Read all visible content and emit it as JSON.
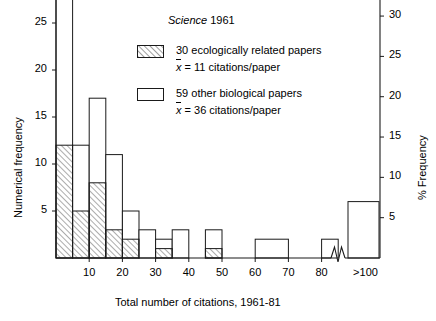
{
  "chart_data": {
    "type": "bar",
    "title_italic_part": "Science",
    "title_year": "1961",
    "xlabel": "Total number of citations,  1961-81",
    "ylabel": "Numerical frequency",
    "ylabel_right": "% Frequency",
    "ylim": [
      0,
      32
    ],
    "ylim_right": [
      0,
      37.3
    ],
    "yticks": [
      5,
      10,
      15,
      20,
      25,
      30
    ],
    "yticks_right": [
      5,
      10,
      15,
      20,
      25,
      30,
      35
    ],
    "xticks": [
      "10",
      "20",
      "30",
      "40",
      "50",
      "60",
      "70",
      "80",
      ">100"
    ],
    "grid": false,
    "legend_position": "upper-center",
    "axis_break": true,
    "axis_break_label": ">100",
    "bin_width": 5,
    "series": [
      {
        "name": "30 ecologically related papers",
        "mean_label": "x̄ = 11 citations/paper",
        "mean_value": 11,
        "count": 30,
        "fill": "hatched",
        "bins": [
          {
            "x0": 0,
            "x1": 5,
            "value": 12
          },
          {
            "x0": 5,
            "x1": 10,
            "value": 5
          },
          {
            "x0": 10,
            "x1": 15,
            "value": 8
          },
          {
            "x0": 15,
            "x1": 20,
            "value": 3
          },
          {
            "x0": 20,
            "x1": 25,
            "value": 2
          },
          {
            "x0": 25,
            "x1": 30,
            "value": 0
          },
          {
            "x0": 30,
            "x1": 35,
            "value": 1
          },
          {
            "x0": 45,
            "x1": 50,
            "value": 1
          }
        ]
      },
      {
        "name": "59 other biological papers",
        "mean_label": "x̄ = 36 citations/paper",
        "mean_value": 36,
        "count": 59,
        "fill": "open",
        "bins": [
          {
            "x0": 0,
            "x1": 5,
            "value": 28
          },
          {
            "x0": 5,
            "x1": 10,
            "value": 12
          },
          {
            "x0": 10,
            "x1": 15,
            "value": 17
          },
          {
            "x0": 15,
            "x1": 20,
            "value": 11
          },
          {
            "x0": 20,
            "x1": 25,
            "value": 5
          },
          {
            "x0": 25,
            "x1": 30,
            "value": 3
          },
          {
            "x0": 30,
            "x1": 35,
            "value": 2
          },
          {
            "x0": 35,
            "x1": 40,
            "value": 3
          },
          {
            "x0": 45,
            "x1": 50,
            "value": 3
          },
          {
            "x0": 60,
            "x1": 70,
            "value": 2
          },
          {
            "x0": 80,
            "x1": 85,
            "value": 2
          },
          {
            "x0": 100,
            "x1": 110,
            "value": 6
          }
        ]
      }
    ]
  },
  "legend": {
    "entry1_label": "30 ecologically related papers",
    "entry1_mean": "= 11 citations/paper",
    "entry1_symbol": "x",
    "entry2_label": "59 other biological papers",
    "entry2_mean": "= 36 citations/paper",
    "entry2_symbol": "x"
  },
  "colors": {
    "line": "#1a1a1a",
    "background": "#ffffff",
    "hatch": "#4d4d4d"
  }
}
